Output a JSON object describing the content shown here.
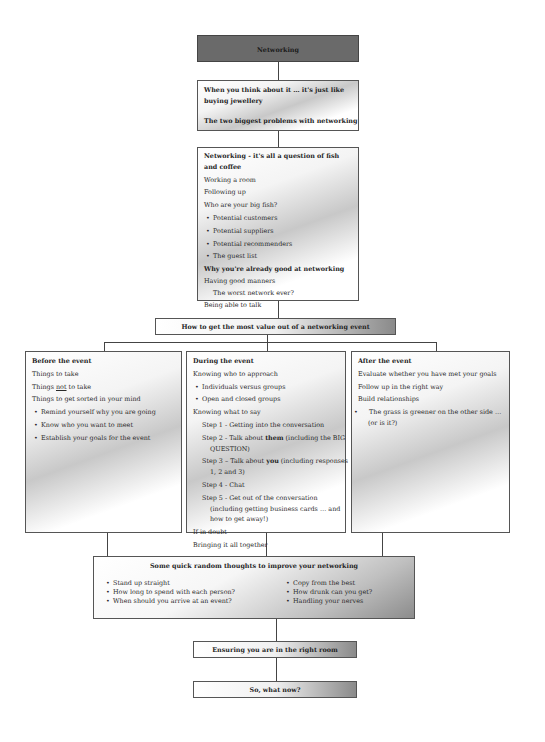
{
  "diagram": {
    "title": "Networking",
    "intro": {
      "line1": "When you think about it … it's just like buying jewellery",
      "line2": "The two biggest problems with networking"
    },
    "fish": {
      "heading": "Networking - it's all a question of fish and coffee",
      "items": [
        "Working a room",
        "Following up",
        "Who are your big fish?"
      ],
      "bullets": [
        "Potential customers",
        "Potential suppliers",
        "Potential recommenders",
        "The guest list"
      ],
      "subheading": "Why you're already good at networking",
      "items2": [
        "Having good manners"
      ],
      "indented": "The worst network ever?",
      "last": "Being able to talk"
    },
    "value_event": "How to get the most value out of a networking event",
    "before": {
      "heading": "Before the event",
      "items": [
        "Things to take",
        "Things",
        "not",
        "to take",
        "Things to get sorted in your mind"
      ],
      "bullets": [
        "Remind yourself why you are going",
        "Know who you want to meet",
        "Establish your goals for the event"
      ]
    },
    "during": {
      "heading": "During the event",
      "approach": "Knowing who to approach",
      "bullets": [
        "Individuals versus groups",
        "Open and closed groups"
      ],
      "say": "Knowing what to say",
      "steps": [
        {
          "prefix": "Step 1 - Getting into the conversation"
        },
        {
          "prefix": "Step 2 - Talk about ",
          "bold": "them",
          "suffix": " (including the BIG QUESTION)"
        },
        {
          "prefix": "Step 3 – Talk about ",
          "bold": "you",
          "suffix": " (including responses 1, 2 and 3)"
        },
        {
          "prefix": "Step 4 -  Chat"
        },
        {
          "prefix": "Step 5 -  Get out of the conversation (including getting business cards … and how to get away!)"
        }
      ],
      "doubt": "If in doubt",
      "together": "Bringing it all together"
    },
    "after": {
      "heading": "After the event",
      "items": [
        "Evaluate whether you have met your goals",
        "Follow up in the right way",
        "Build relationships"
      ],
      "bullets": [
        "The grass is greener on the other side … (or is it?)"
      ]
    },
    "random": {
      "heading": "Some quick random thoughts to improve your networking",
      "left": [
        "Stand up straight",
        "How long to spend with each person?",
        "When should you arrive at an event?"
      ],
      "right": [
        "Copy from the best",
        "How drunk can you get?",
        "Handling your nerves"
      ]
    },
    "right_room": "Ensuring you are in the right room",
    "what_now": "So, what now?"
  }
}
